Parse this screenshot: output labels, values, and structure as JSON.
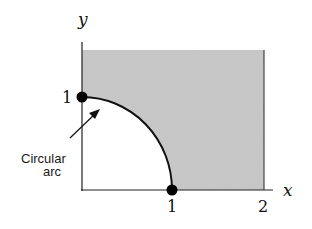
{
  "diagram": {
    "axes": {
      "x_label": "x",
      "y_label": "y",
      "x_ticks": [
        "1",
        "2"
      ],
      "y_ticks": [
        "1"
      ]
    },
    "region": {
      "description": "shaded region outside quarter circle, 0<=x<=2, 0<=y<=1.5",
      "fill_color": "#c8c8c8"
    },
    "annotation": {
      "line1": "Circular",
      "line2": "arc"
    },
    "points": [
      {
        "x": 0,
        "y": 1
      },
      {
        "x": 1,
        "y": 0
      }
    ]
  }
}
